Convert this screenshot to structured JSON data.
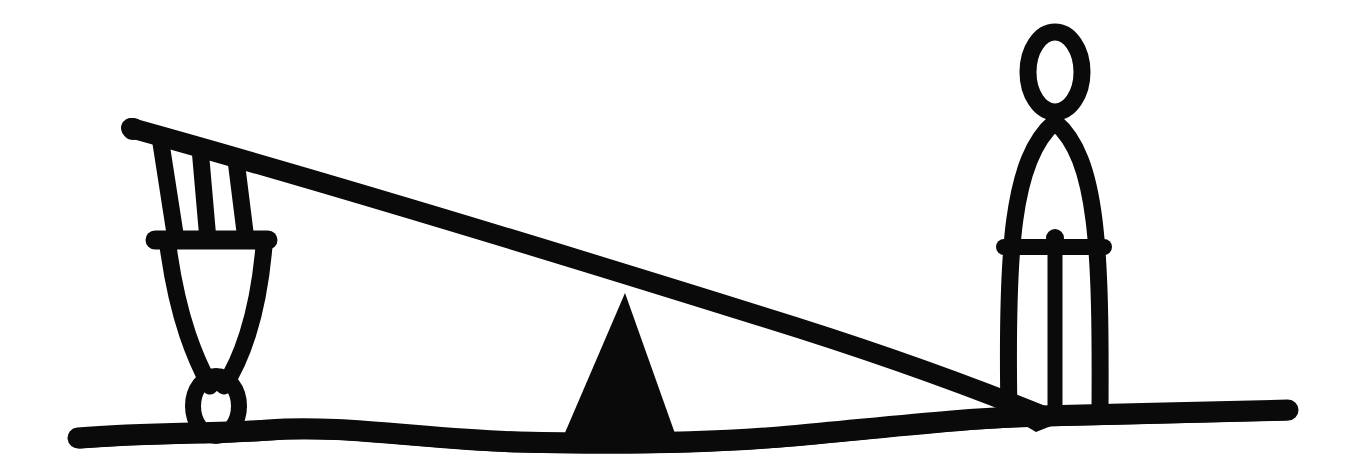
{
  "meta": {
    "title": "Seesaw Lever Illustration",
    "style": "hand-drawn black brush line art",
    "background_color": "#ffffff",
    "ink_color": "#0a0a0a",
    "canvas": {
      "width": 1369,
      "height": 471
    }
  },
  "scene": {
    "description": "A hand-drawn seesaw: a tall standing figure on the right holds the plank end down to the ground while a smaller figure on the left is lifted into the air; a solid triangular fulcrum sits at the center.",
    "elements": [
      {
        "name": "ground-line",
        "label": "Ground"
      },
      {
        "name": "fulcrum-triangle",
        "label": "Fulcrum"
      },
      {
        "name": "seesaw-plank",
        "label": "Lever plank"
      },
      {
        "name": "left-figure",
        "label": "Lifted figure"
      },
      {
        "name": "right-figure",
        "label": "Standing figure"
      }
    ]
  },
  "geometry": {
    "ground": {
      "path": "M 78 438 C 150 432 215 434 268 430 C 340 424 430 440 520 442 C 600 444 700 444 790 436 C 880 428 960 418 1040 416 C 1120 414 1210 412 1288 410",
      "stroke_width": 21
    },
    "plank": {
      "path": "M 131 128 C 300 175 520 241 760 316 C 880 353 980 390 1046 417",
      "stroke_width": 20
    },
    "fulcrum": {
      "points": "625,293 678,442 561,442",
      "apex": [
        625,
        293
      ],
      "base_left": [
        561,
        442
      ],
      "base_right": [
        678,
        442
      ]
    },
    "left_figure": {
      "arm_outer": "M 160 137 L 176 240",
      "arm_inner": "M 200 148 L 208 240",
      "shoulder_edge": "M 236 160 L 246 240",
      "shoulder_bar": "M 155 240 L 268 240",
      "torso_left": "M 168 246 C 178 320 196 360 210 386",
      "torso_right": "M 264 246 C 258 318 240 362 224 386",
      "head_center": [
        216,
        406
      ],
      "head_rx": 23,
      "head_ry": 30,
      "stroke_width": 17
    },
    "right_figure": {
      "head_center": [
        1055,
        72
      ],
      "head_rx": 27,
      "head_ry": 40,
      "neck": "M 1055 112 L 1055 122",
      "body": "M 1009 414 C 1006 250 1012 158 1055 122 C 1098 158 1101 250 1100 414",
      "belt_bar": "M 1004 247 L 1104 247",
      "leg_gap": "M 1055 250 L 1055 414",
      "stroke_width": 17
    }
  },
  "labels": {
    "left_figure": "lifted person",
    "right_figure": "standing person",
    "fulcrum": "pivot",
    "plank": "beam",
    "ground": "ground"
  }
}
